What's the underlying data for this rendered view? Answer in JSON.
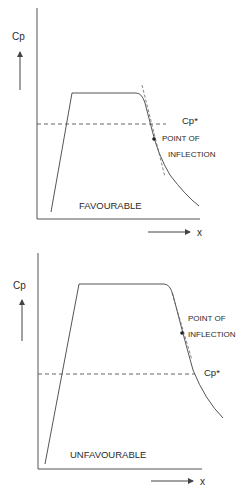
{
  "diagrams": [
    {
      "name": "favourable",
      "y_label": "Cp",
      "x_label": "x",
      "ref_label": "Cp*",
      "inflection_label_line1": "POINT OF",
      "inflection_label_line2": "INFLECTION",
      "caption": "FAVOURABLE"
    },
    {
      "name": "unfavourable",
      "y_label": "Cp",
      "x_label": "x",
      "ref_label": "Cp*",
      "inflection_label_line1": "POINT OF",
      "inflection_label_line2": "INFLECTION",
      "caption": "UNFAVOURABLE"
    }
  ],
  "colors": {
    "line": "#555555",
    "text": "#2a2a2a",
    "background": "#ffffff"
  }
}
